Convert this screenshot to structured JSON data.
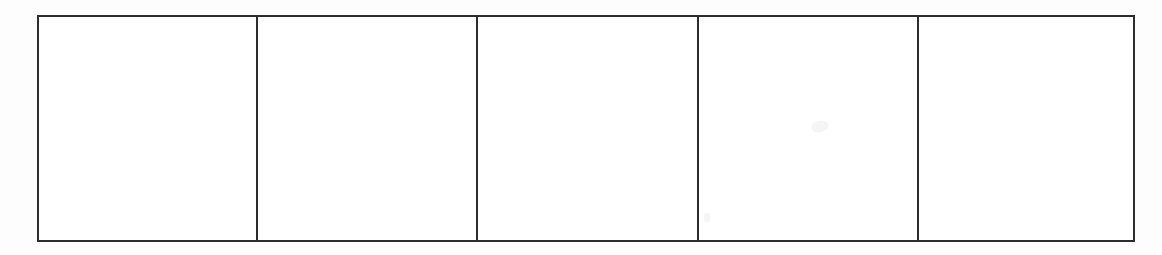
{
  "document": {
    "type": "scanned-document",
    "description": "Blank five-column grid table",
    "background_color": "#fdfdfd",
    "page_width": 1162,
    "page_height": 255
  },
  "table": {
    "name": "blank-grid-table",
    "border_color": "#2d2d2d",
    "cell_fill_color": "#ffffff",
    "border_width_px": 2.5,
    "column_count": 5,
    "row_count": 1,
    "has_header": false,
    "bounds": {
      "left": 37,
      "top": 15,
      "width": 1098,
      "height": 227
    },
    "divider_x_positions": [
      256,
      476,
      697,
      917
    ],
    "column_widths": [
      219,
      220,
      221,
      220,
      218
    ],
    "cells": [
      {
        "index": 1,
        "name": "grid-cell-1",
        "value": ""
      },
      {
        "index": 2,
        "name": "grid-cell-2",
        "value": ""
      },
      {
        "index": 3,
        "name": "grid-cell-3",
        "value": ""
      },
      {
        "index": 4,
        "name": "grid-cell-4",
        "value": ""
      },
      {
        "index": 5,
        "name": "grid-cell-5",
        "value": ""
      }
    ]
  },
  "artifacts": {
    "smudge_color": "#f2f2f4",
    "items": [
      {
        "name": "scan-smudge-upper",
        "cell": 4
      },
      {
        "name": "scan-smudge-lower",
        "cell": 4
      }
    ]
  }
}
